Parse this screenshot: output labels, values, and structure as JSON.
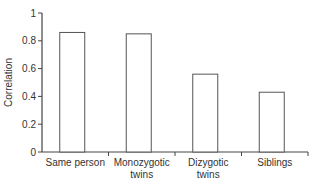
{
  "chart_data": {
    "type": "bar",
    "title": "",
    "xlabel": "",
    "ylabel": "Correlation",
    "ylim": [
      0,
      1
    ],
    "yticks": [
      "0",
      "0.2",
      "0.4",
      "0.6",
      "0.8",
      "1"
    ],
    "categories": [
      "Same person",
      "Monozygotic twins",
      "Dizygotic twins",
      "Siblings"
    ],
    "category_lines": [
      [
        "Same person"
      ],
      [
        "Monozygotic",
        "twins"
      ],
      [
        "Dizygotic",
        "twins"
      ],
      [
        "Siblings"
      ]
    ],
    "values": [
      0.86,
      0.85,
      0.56,
      0.43
    ],
    "grid": false,
    "legend": null,
    "bar_fill": "#ffffff",
    "bar_stroke": "#555555"
  }
}
